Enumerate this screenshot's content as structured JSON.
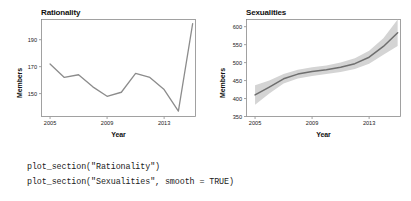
{
  "figure": {
    "panels": [
      {
        "id": "rationality",
        "title": "Rationality",
        "xlabel": "Year",
        "ylabel": "Members"
      },
      {
        "id": "sexualities",
        "title": "Sexualities",
        "xlabel": "Year",
        "ylabel": "Members"
      }
    ]
  },
  "code": {
    "line1": "plot_section(\"Rationality\")",
    "line2": "plot_section(\"Sexualities\", smooth = TRUE)"
  },
  "colors": {
    "line": "#8c8c8c",
    "smooth_line": "#6e6e6e",
    "ribbon": "#d4d4d4",
    "axis": "#8a8a8a",
    "text": "#1a1a1a",
    "background": "#ffffff"
  },
  "chart_data": [
    {
      "type": "line",
      "title": "Rationality",
      "xlabel": "Year",
      "ylabel": "Members",
      "xlim": [
        2004.4,
        2015.2
      ],
      "ylim": [
        133,
        205
      ],
      "xticks": [
        2005,
        2009,
        2013
      ],
      "yticks": [
        150,
        170,
        190
      ],
      "grid": false,
      "legend": "none",
      "x": [
        2005,
        2006,
        2007,
        2008,
        2009,
        2010,
        2011,
        2012,
        2013,
        2014,
        2015
      ],
      "values": [
        172,
        162,
        164,
        155,
        148,
        151,
        165,
        162,
        153,
        137,
        202
      ]
    },
    {
      "type": "line",
      "title": "Sexualities",
      "subtitle": "smoothed trend with confidence ribbon",
      "xlabel": "Year",
      "ylabel": "Members",
      "xlim": [
        2004.4,
        2015.2
      ],
      "ylim": [
        350,
        620
      ],
      "xticks": [
        2005,
        2009,
        2013
      ],
      "yticks": [
        350,
        400,
        450,
        500,
        550,
        600
      ],
      "grid": false,
      "legend": "none",
      "smooth": true,
      "x": [
        2005,
        2006,
        2007,
        2008,
        2009,
        2010,
        2011,
        2012,
        2013,
        2014,
        2015
      ],
      "series": [
        {
          "name": "smooth fit",
          "values": [
            410,
            432,
            455,
            468,
            475,
            480,
            487,
            497,
            515,
            545,
            583
          ]
        },
        {
          "name": "confidence upper",
          "values": [
            437,
            450,
            468,
            480,
            487,
            492,
            500,
            512,
            533,
            568,
            620
          ]
        },
        {
          "name": "confidence lower",
          "values": [
            383,
            414,
            442,
            456,
            463,
            468,
            474,
            482,
            497,
            522,
            546
          ]
        }
      ]
    }
  ]
}
